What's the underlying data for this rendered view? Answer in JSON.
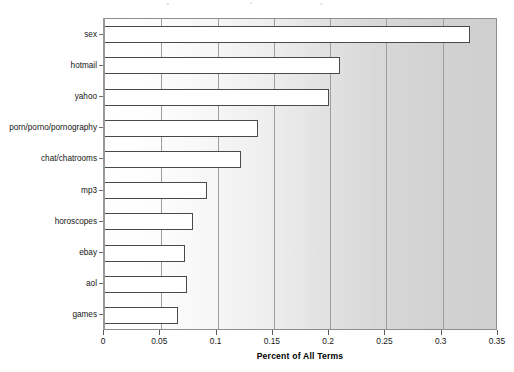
{
  "chart_data": {
    "type": "bar",
    "orientation": "horizontal",
    "title": "",
    "xlabel": "Percent of All Terms",
    "ylabel": "",
    "xlim": [
      0,
      0.35
    ],
    "xticks": [
      "0",
      "0.05",
      "0.1",
      "0.15",
      "0.2",
      "0.25",
      "0.3",
      "0.35"
    ],
    "xtick_values": [
      0,
      0.05,
      0.1,
      0.15,
      0.2,
      0.25,
      0.3,
      0.35
    ],
    "grid": true,
    "legend": null,
    "categories": [
      "sex",
      "hotmail",
      "yahoo",
      "porn/porno/pornography",
      "chat/chatrooms",
      "mp3",
      "horoscopes",
      "ebay",
      "aol",
      "games"
    ],
    "values": [
      0.324,
      0.209,
      0.199,
      0.136,
      0.121,
      0.091,
      0.078,
      0.071,
      0.073,
      0.065
    ],
    "bar_face_color": "#ffffff",
    "bar_edge_color": "#4a4a4a",
    "plot_bg_left_color": "#ffffff",
    "plot_bg_right_color": "#cfcfcf",
    "gridline_color": "#9e9e9e",
    "axis_color": "#8e8e8e"
  }
}
